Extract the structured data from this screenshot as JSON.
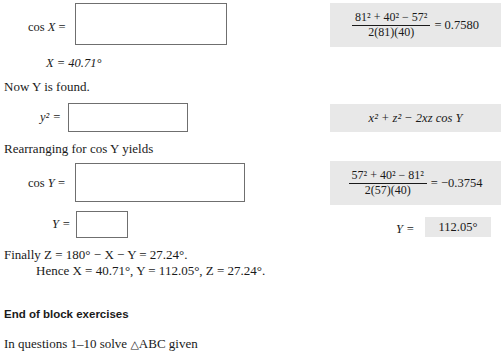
{
  "worked_example": {
    "step1": {
      "label_prefix": "cos",
      "label_var": "X",
      "label_eq": "=",
      "answer_box_value": "",
      "solution": {
        "numerator": "81² + 40² − 57²",
        "denominator": "2(81)(40)",
        "equals": "= 0.7580"
      }
    },
    "step1_result": "X = 40.71°",
    "transition_text": "Now Y is found.",
    "step2": {
      "label": "y² =",
      "answer_box_value": "",
      "solution": "x² + z² − 2xz cos Y"
    },
    "rearrange_text": "Rearranging for cos Y yields",
    "step3": {
      "label_prefix": "cos",
      "label_var": "Y",
      "label_eq": "=",
      "answer_box_value": "",
      "solution": {
        "numerator": "57² + 40² − 81²",
        "denominator": "2(57)(40)",
        "equals": "= −0.3754"
      }
    },
    "step4": {
      "label": "Y =",
      "answer_box_value": "",
      "solution_label": "Y =",
      "solution_value": "112.05°"
    },
    "final_line": "Finally Z = 180° − X − Y = 27.24°.",
    "hence_line": "Hence X = 40.71°, Y = 112.05°, Z = 27.24°."
  },
  "footer": {
    "block_heading": "End of block exercises",
    "questions_intro_pre": "In questions 1–10 solve ",
    "questions_intro_triangle": "△",
    "questions_intro_post": "ABC given"
  },
  "colors": {
    "shade_background": "#e8e8e8",
    "box_border": "#6f6f6f",
    "text": "#1a1a1a"
  }
}
